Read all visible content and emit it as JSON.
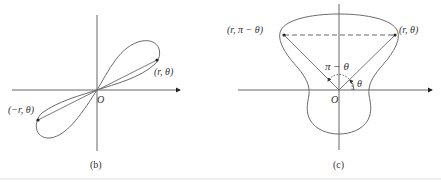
{
  "figure_b": {
    "caption": "(b)",
    "origin_label": "O",
    "point_label": "(r, θ)",
    "neg_point_label": "(−r, θ)"
  },
  "figure_c": {
    "caption": "(c)",
    "origin_label": "O",
    "point_label_right": "(r, θ)",
    "point_label_left": "(r, π − θ)",
    "angle_label_supplement": "π − θ",
    "angle_label": "θ"
  },
  "colors": {
    "stroke": "#6b6b6b",
    "axis": "#555555",
    "text": "#333333",
    "point": "#222222"
  }
}
